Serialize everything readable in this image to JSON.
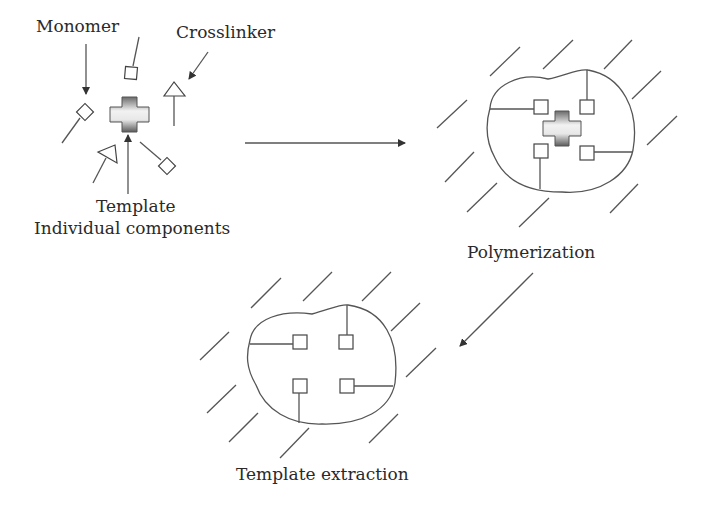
{
  "diagram": {
    "type": "process-flow",
    "stages": [
      {
        "id": "components",
        "label": "Individual components"
      },
      {
        "id": "polymerization",
        "label": "Polymerization"
      },
      {
        "id": "extraction",
        "label": "Template extraction"
      }
    ],
    "component_labels": {
      "monomer": "Monomer",
      "crosslinker": "Crosslinker",
      "template": "Template"
    },
    "flow": [
      {
        "from": "components",
        "to": "polymerization",
        "direction": "right"
      },
      {
        "from": "polymerization",
        "to": "extraction",
        "direction": "down-left"
      }
    ],
    "colors": {
      "line": "#555555",
      "template_dark": "#6a6a6a",
      "template_light": "#f2f2f2",
      "text": "#2a2a2a"
    }
  }
}
